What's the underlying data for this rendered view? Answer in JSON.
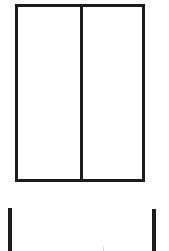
{
  "diagram": {
    "type": "line-drawing",
    "stroke_color": "#1c1c1c",
    "background_color": "#ffffff",
    "frame": {
      "panes": 2,
      "divider": "vertical-center"
    },
    "posts": {
      "count": 2
    }
  }
}
